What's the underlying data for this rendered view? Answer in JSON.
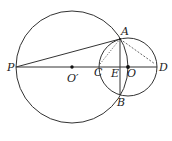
{
  "diagram": {
    "points": {
      "P": "P",
      "O_prime": "O′",
      "C": "C",
      "E": "E",
      "O": "O",
      "D": "D",
      "A": "A",
      "B": "B"
    },
    "segments": [
      {
        "from": "P",
        "to": "D",
        "style": "solid"
      },
      {
        "from": "P",
        "to": "A",
        "style": "solid"
      },
      {
        "from": "A",
        "to": "B",
        "style": "solid"
      },
      {
        "from": "A",
        "to": "C",
        "style": "dotted"
      },
      {
        "from": "A",
        "to": "D",
        "style": "dashed"
      }
    ],
    "circles": [
      {
        "center": "O′",
        "through": "P"
      },
      {
        "center": "O",
        "diameter": "CD"
      }
    ],
    "stroke_color": "#333333"
  }
}
